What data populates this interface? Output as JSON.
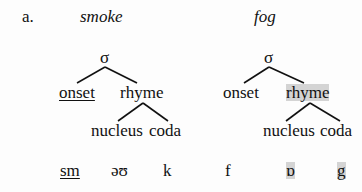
{
  "example_label": "a.",
  "left": {
    "word": "smoke",
    "root": "σ",
    "onset": "onset",
    "rhyme": "rhyme",
    "nucleus": "nucleus",
    "coda": "coda",
    "segments": {
      "onset": "sm",
      "nucleus": "əʊ",
      "coda": "k"
    }
  },
  "right": {
    "word": "fog",
    "root": "σ",
    "onset": "onset",
    "rhyme": "rhyme",
    "nucleus": "nucleus",
    "coda": "coda",
    "segments": {
      "onset": "f",
      "nucleus": "ɒ",
      "coda": "g"
    }
  },
  "colors": {
    "highlight": "#d4d4d4",
    "line": "#111111"
  }
}
